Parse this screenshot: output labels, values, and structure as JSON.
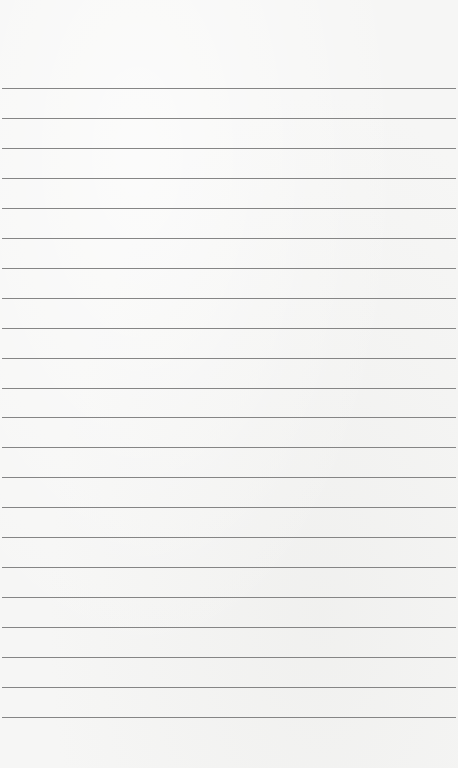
{
  "page": {
    "type": "lined-notepad",
    "ruled_line_count": 22,
    "colors": {
      "paper": "#f6f6f5",
      "rule": "#858585"
    },
    "lines": [
      {
        "text": ""
      },
      {
        "text": ""
      },
      {
        "text": ""
      },
      {
        "text": ""
      },
      {
        "text": ""
      },
      {
        "text": ""
      },
      {
        "text": ""
      },
      {
        "text": ""
      },
      {
        "text": ""
      },
      {
        "text": ""
      },
      {
        "text": ""
      },
      {
        "text": ""
      },
      {
        "text": ""
      },
      {
        "text": ""
      },
      {
        "text": ""
      },
      {
        "text": ""
      },
      {
        "text": ""
      },
      {
        "text": ""
      },
      {
        "text": ""
      },
      {
        "text": ""
      },
      {
        "text": ""
      },
      {
        "text": ""
      }
    ]
  }
}
